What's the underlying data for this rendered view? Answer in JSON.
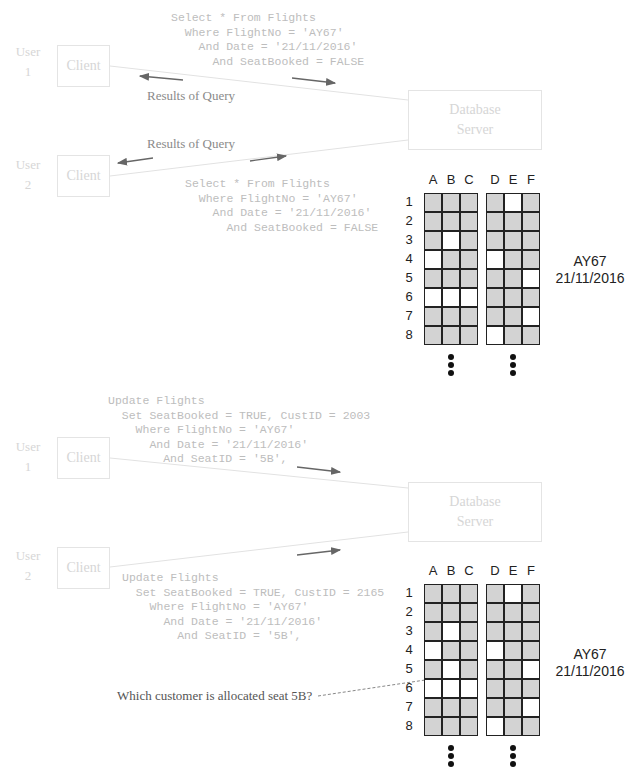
{
  "panels": [
    {
      "id": "select",
      "user1": {
        "label_line1": "User",
        "label_line2": "1",
        "client": "Client"
      },
      "user2": {
        "label_line1": "User",
        "label_line2": "2",
        "client": "Client"
      },
      "server": {
        "line1": "Database",
        "line2": "Server"
      },
      "query1": "Select * From Flights\n  Where FlightNo = 'AY67'\n    And Date = '21/11/2016'\n      And SeatBooked = FALSE",
      "query2": "Select * From Flights\n  Where FlightNo = 'AY67'\n    And Date = '21/11/2016'\n      And SeatBooked = FALSE",
      "result1": "Results of Query",
      "result2": "Results of Query",
      "flight": {
        "number": "AY67",
        "date": "21/11/2016"
      }
    },
    {
      "id": "update",
      "user1": {
        "label_line1": "User",
        "label_line2": "1",
        "client": "Client"
      },
      "user2": {
        "label_line1": "User",
        "label_line2": "2",
        "client": "Client"
      },
      "server": {
        "line1": "Database",
        "line2": "Server"
      },
      "query1": "Update Flights\n  Set SeatBooked = TRUE, CustID = 2003\n    Where FlightNo = 'AY67'\n      And Date = '21/11/2016'\n        And SeatID = '5B',",
      "query2": "Update Flights\n  Set SeatBooked = TRUE, CustID = 2165\n    Where FlightNo = 'AY67'\n      And Date = '21/11/2016'\n        And SeatID = '5B',",
      "question": "Which customer is allocated seat 5B?",
      "flight": {
        "number": "AY67",
        "date": "21/11/2016"
      }
    }
  ],
  "seatmap": {
    "columns": [
      "A",
      "B",
      "C",
      "D",
      "E",
      "F"
    ],
    "rows": [
      "1",
      "2",
      "3",
      "4",
      "5",
      "6",
      "7",
      "8"
    ],
    "legend": {
      "booked_color": "#d3d3d3",
      "free_color": "#ffffff"
    },
    "top_free_seats": [
      "1E",
      "3B",
      "4A",
      "4D",
      "5F",
      "6A",
      "6B",
      "6C",
      "7F",
      "8D"
    ],
    "bottom_free_seats": [
      "1E",
      "3B",
      "4A",
      "4D",
      "5B",
      "5F",
      "6A",
      "6B",
      "6C",
      "7F",
      "8D"
    ]
  }
}
